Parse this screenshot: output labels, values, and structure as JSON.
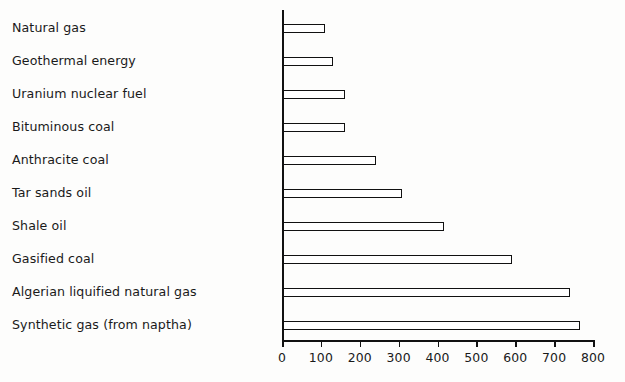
{
  "chart_data": {
    "type": "bar",
    "orientation": "horizontal",
    "title": "",
    "subtitle": "",
    "xlabel": "",
    "ylabel": "",
    "categories": [
      "Natural gas",
      "Geothermal energy",
      "Uranium nuclear fuel",
      "Bituminous coal",
      "Anthracite coal",
      "Tar sands oil",
      "Shale oil",
      "Gasified coal",
      "Algerian liquified natural gas",
      "Synthetic gas (from naptha)"
    ],
    "values": [
      108,
      129,
      160,
      160,
      240,
      305,
      413,
      590,
      738,
      765
    ],
    "xlim": [
      0,
      800
    ],
    "xticks": [
      0,
      100,
      200,
      300,
      400,
      500,
      600,
      700,
      800
    ],
    "xticklabels": [
      "0",
      "100",
      "200",
      "300",
      "400",
      "500",
      "600",
      "700",
      "800"
    ],
    "grid": false,
    "legend": false,
    "legend_position": "none",
    "bar_style": "hollow-outline",
    "bar_fill_color": "#ffffff",
    "bar_edge_color": "#111111",
    "axis_color": "#111111",
    "background_color": "#fdfdfc",
    "text_color": "#1a1a1a"
  }
}
